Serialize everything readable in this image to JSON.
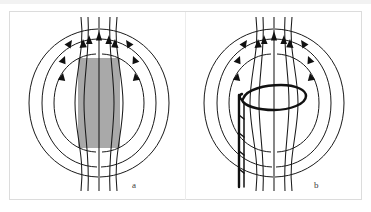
{
  "figure": {
    "background_color": "#ffffff",
    "frame_color": "#dcdcdc",
    "line_color": "#1a1a1a",
    "core_color": "#a9a9a9",
    "wire_color": "#111111"
  },
  "panels": [
    {
      "id": "a",
      "label": "a",
      "subject": "bar-magnet",
      "core": {
        "shape": "rectangle",
        "fill": "#a9a9a9",
        "x": 69,
        "y": 47,
        "width": 42,
        "height": 90
      },
      "field_lines": 5,
      "center_lines": 5,
      "arrow_direction": "upward-through-core"
    },
    {
      "id": "b",
      "label": "b",
      "subject": "current-loop",
      "loop": {
        "shape": "ellipse",
        "description": "single conducting loop encircling the field lines"
      },
      "leads": {
        "description": "twisted pair of lead wires descending from the loop"
      },
      "field_lines": 5,
      "center_lines": 5,
      "arrow_direction": "upward-through-loop"
    }
  ],
  "labels": {
    "panel_a": "a",
    "panel_b": "b"
  }
}
